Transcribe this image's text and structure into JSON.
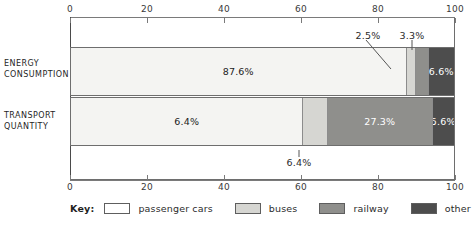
{
  "chart_data": {
    "type": "bar",
    "subtype": "stacked-horizontal-100",
    "title": "",
    "xlabel": "",
    "ylabel": "",
    "xlim": [
      0,
      100
    ],
    "grid": false,
    "legend_position": "bottom",
    "categories": [
      "ENERGY CONSUMPTION",
      "TRANSPORT QUANTITY"
    ],
    "series": [
      {
        "name": "passenger cars",
        "color": "#f4f4f2",
        "values": [
          87.6,
          6.4
        ]
      },
      {
        "name": "buses",
        "color": "#d6d6d2",
        "values": [
          2.5,
          6.4
        ]
      },
      {
        "name": "railway",
        "color": "#8f8f8c",
        "values": [
          3.3,
          27.3
        ]
      },
      {
        "name": "other",
        "color": "#4d4d4d",
        "values": [
          6.6,
          5.6
        ]
      }
    ],
    "axis_ticks": [
      0,
      20,
      40,
      60,
      80,
      100
    ],
    "tick_labels": [
      "0",
      "20",
      "40",
      "60",
      "80",
      "100"
    ],
    "data_labels": {
      "energy": [
        "87.6%",
        "2.5%",
        "3.3%",
        "6.6%"
      ],
      "transport": [
        "6.4%",
        "6.4%",
        "27.3%",
        "5.6%"
      ]
    },
    "annotations": [
      {
        "text": "2.5%",
        "position": "above",
        "points_to": "energy-buses"
      },
      {
        "text": "3.3%",
        "position": "above",
        "points_to": "energy-railway"
      },
      {
        "text": "6.4%",
        "position": "below",
        "points_to": "transport-buses"
      }
    ]
  },
  "cropped_title": "",
  "axis": {
    "top_labels": [
      "0",
      "20",
      "40",
      "60",
      "80",
      "100"
    ],
    "bottom_labels": [
      "0",
      "20",
      "40",
      "60",
      "80",
      "100"
    ]
  },
  "rows": {
    "energy": {
      "title_line1": "ENERGY",
      "title_line2": "CONSUMPTION",
      "segments": [
        {
          "name": "passenger cars",
          "value": 87.6,
          "label": "87.6%",
          "show_label": true
        },
        {
          "name": "buses",
          "value": 2.5,
          "label": "2.5%",
          "show_label": false
        },
        {
          "name": "railway",
          "value": 3.3,
          "label": "3.3%",
          "show_label": false
        },
        {
          "name": "other",
          "value": 6.6,
          "label": "6.6%",
          "show_label": true
        }
      ]
    },
    "transport": {
      "title_line1": "TRANSPORT",
      "title_line2": "QUANTITY",
      "segments": [
        {
          "name": "passenger cars",
          "value": 60.7,
          "label": "6.4%",
          "show_label": true
        },
        {
          "name": "buses",
          "value": 6.4,
          "label": "6.4%",
          "show_label": false
        },
        {
          "name": "railway",
          "value": 27.3,
          "label": "27.3%",
          "show_label": true
        },
        {
          "name": "other",
          "value": 5.6,
          "label": "5.6%",
          "show_label": true
        }
      ]
    }
  },
  "callouts": {
    "energy_buses": "2.5%",
    "energy_railway": "3.3%",
    "transport_buses": "6.4%"
  },
  "legend": {
    "key_label": "Key:",
    "items": [
      {
        "label": "passenger cars",
        "color": "#ffffff"
      },
      {
        "label": "buses",
        "color": "#d6d6d2"
      },
      {
        "label": "railway",
        "color": "#8f8f8c"
      },
      {
        "label": "other",
        "color": "#4d4d4d"
      }
    ]
  },
  "colors": {
    "passenger_cars": "#f4f4f2",
    "buses": "#d6d6d2",
    "railway": "#8f8f8c",
    "other": "#4d4d4d",
    "frame": "#6e6e6e",
    "text": "#2b2b2b"
  }
}
